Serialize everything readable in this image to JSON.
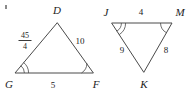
{
  "figure": {
    "background_color": "#ffffff",
    "stroke_color": "#4a4a4a",
    "text_color": "#222222"
  },
  "triangle_left": {
    "name": "triangle-DGF",
    "vertices": [
      {
        "id": "D",
        "label": "D",
        "x": 57,
        "y": 23,
        "label_x": 57,
        "label_y": 14
      },
      {
        "id": "G",
        "label": "G",
        "x": 15,
        "y": 73,
        "label_x": 9,
        "label_y": 88
      },
      {
        "id": "F",
        "label": "F",
        "x": 93,
        "y": 73,
        "label_x": 96,
        "label_y": 88
      }
    ],
    "sides": [
      {
        "id": "GD",
        "measure": "45/4",
        "numerator": "45",
        "denominator": "4",
        "is_fraction": true,
        "label_x": 25,
        "label_y": 40
      },
      {
        "id": "DF",
        "measure": "10",
        "is_fraction": false,
        "label_x": 80,
        "label_y": 44
      },
      {
        "id": "GF",
        "measure": "5",
        "is_fraction": false,
        "label_x": 53,
        "label_y": 88
      }
    ],
    "angle_marks": [
      {
        "vertex": "G",
        "arcs": 2
      },
      {
        "vertex": "F",
        "arcs": 1
      }
    ]
  },
  "triangle_right": {
    "name": "triangle-JMK",
    "vertices": [
      {
        "id": "J",
        "label": "J",
        "x": 112,
        "y": 23,
        "label_x": 106,
        "label_y": 16
      },
      {
        "id": "M",
        "label": "M",
        "x": 172,
        "y": 23,
        "label_x": 180,
        "label_y": 16
      },
      {
        "id": "K",
        "label": "K",
        "x": 144,
        "y": 72,
        "label_x": 144,
        "label_y": 88
      }
    ],
    "sides": [
      {
        "id": "JM",
        "measure": "4",
        "is_fraction": false,
        "label_x": 141,
        "label_y": 15
      },
      {
        "id": "JK",
        "measure": "9",
        "is_fraction": false,
        "label_x": 122,
        "label_y": 53
      },
      {
        "id": "MK",
        "measure": "8",
        "is_fraction": false,
        "label_x": 166,
        "label_y": 53
      }
    ],
    "angle_marks": [
      {
        "vertex": "J",
        "arcs": 2
      },
      {
        "vertex": "M",
        "arcs": 1
      }
    ]
  }
}
